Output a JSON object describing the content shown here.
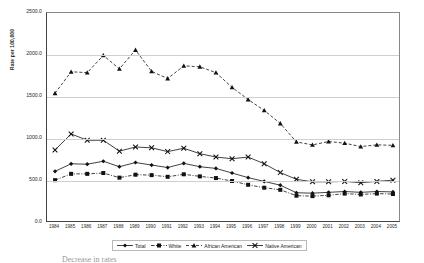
{
  "chart_data": {
    "type": "line",
    "title": "",
    "xlabel": "",
    "ylabel": "Rate per 100,000",
    "ylim": [
      0,
      2500
    ],
    "ytick_labels": [
      "0.0",
      "500.0",
      "1000.0",
      "1500.0",
      "2000.0",
      "2500.0"
    ],
    "ytick_values": [
      0,
      500,
      1000,
      1500,
      2000,
      2500
    ],
    "grid": true,
    "grid_axis": "y",
    "legend_position": "bottom",
    "categories": [
      "1984",
      "1985",
      "1986",
      "1987",
      "1988",
      "1989",
      "1990",
      "1991",
      "1992",
      "1993",
      "1994",
      "1995",
      "1996",
      "1997",
      "1998",
      "1999",
      "2000",
      "2001",
      "2002",
      "2003",
      "2004",
      "2005"
    ],
    "series": [
      {
        "name": "Total",
        "marker": "diamond",
        "line_style": "solid",
        "values": [
          615,
          705,
          700,
          735,
          670,
          720,
          690,
          660,
          710,
          670,
          650,
          595,
          540,
          495,
          450,
          360,
          355,
          365,
          375,
          365,
          375,
          370
        ]
      },
      {
        "name": "White",
        "marker": "square",
        "line_style": "dash-dot",
        "values": [
          510,
          585,
          585,
          595,
          540,
          575,
          570,
          550,
          580,
          555,
          535,
          500,
          455,
          420,
          395,
          325,
          320,
          330,
          350,
          340,
          350,
          345
        ]
      },
      {
        "name": "African American",
        "marker": "triangle",
        "line_style": "dashed",
        "values": [
          1545,
          1800,
          1790,
          1995,
          1835,
          2060,
          1805,
          1720,
          1870,
          1860,
          1790,
          1615,
          1470,
          1340,
          1185,
          965,
          930,
          970,
          950,
          910,
          930,
          925
        ]
      },
      {
        "name": "Native American",
        "marker": "cross",
        "line_style": "solid",
        "values": [
          870,
          1060,
          985,
          985,
          855,
          905,
          895,
          850,
          890,
          825,
          785,
          765,
          785,
          705,
          600,
          520,
          490,
          490,
          495,
          480,
          495,
          510
        ]
      }
    ]
  },
  "axis": {
    "ylabel": "Rate per 100,000"
  },
  "legend": {
    "items": [
      {
        "label": "Total"
      },
      {
        "label": "White"
      },
      {
        "label": "African American"
      },
      {
        "label": "Native American"
      }
    ]
  },
  "bottom_scrap": {
    "text": "Decrease in rates"
  }
}
